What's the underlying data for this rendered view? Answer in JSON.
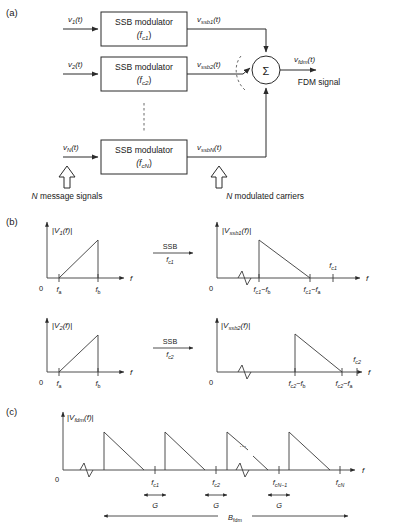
{
  "figure": {
    "panels": [
      {
        "id": "a",
        "label": "(a)"
      },
      {
        "id": "b",
        "label": "(b)"
      },
      {
        "id": "c",
        "label": "(c)"
      }
    ]
  },
  "panel_a": {
    "panel_label": "(a)",
    "blocks": [
      {
        "title": "SSB modulator",
        "carrier": "(f",
        "carrier_sub": "c1",
        "carrier_end": ")"
      },
      {
        "title": "SSB modulator",
        "carrier": "(f",
        "carrier_sub": "c2",
        "carrier_end": ")"
      },
      {
        "title": "SSB modulator",
        "carrier": "(f",
        "carrier_sub": "cN",
        "carrier_end": ")"
      }
    ],
    "inputs": [
      {
        "base": "v",
        "sub": "1",
        "tail": "(t)"
      },
      {
        "base": "v",
        "sub": "2",
        "tail": "(t)"
      },
      {
        "base": "v",
        "sub": "N",
        "tail": "(t)"
      }
    ],
    "outputs": [
      {
        "base": "v",
        "sub": "ssb1",
        "tail": "(t)"
      },
      {
        "base": "v",
        "sub": "ssb2",
        "tail": "(t)"
      },
      {
        "base": "v",
        "sub": "ssbN",
        "tail": "(t)"
      }
    ],
    "summer_symbol": "Σ",
    "result": {
      "base": "v",
      "sub": "fdm",
      "tail": "(t)"
    },
    "result_caption": "FDM signal",
    "annotation_left": "N message signals",
    "annotation_right": "N modulated carriers",
    "annotation_left_italic_prefix": "N",
    "annotation_right_italic_prefix": "N"
  },
  "panel_b": {
    "panel_label": "(b)",
    "rows": [
      {
        "left": {
          "ylabel_pre": "|V",
          "ylabel_sub": "1",
          "ylabel_post": "(f)|",
          "origin": "0",
          "xlabel": "f",
          "ticks": [
            {
              "label_pre": "f",
              "label_sub": "a"
            },
            {
              "label_pre": "f",
              "label_sub": "b"
            }
          ]
        },
        "arrow": {
          "top": "SSB",
          "bottom_pre": "f",
          "bottom_sub": "c1"
        },
        "right": {
          "ylabel_pre": "|V",
          "ylabel_sub": "ssb1",
          "ylabel_post": "(f)|",
          "origin": "0",
          "xlabel": "f",
          "ticks": [
            {
              "label_pre": "f",
              "label_sub": "c1",
              "label_post": "−f",
              "label_post_sub": "b"
            },
            {
              "label_pre": "f",
              "label_sub": "c1",
              "label_post": "−f",
              "label_post_sub": "a"
            }
          ],
          "carrier_tick": {
            "label_pre": "f",
            "label_sub": "c1"
          }
        }
      },
      {
        "left": {
          "ylabel_pre": "|V",
          "ylabel_sub": "2",
          "ylabel_post": "(f)|",
          "origin": "0",
          "xlabel": "f",
          "ticks": [
            {
              "label_pre": "f",
              "label_sub": "a"
            },
            {
              "label_pre": "f",
              "label_sub": "b"
            }
          ]
        },
        "arrow": {
          "top": "SSB",
          "bottom_pre": "f",
          "bottom_sub": "c2"
        },
        "right": {
          "ylabel_pre": "|V",
          "ylabel_sub": "ssb2",
          "ylabel_post": "(f)|",
          "origin": "0",
          "xlabel": "f",
          "ticks": [
            {
              "label_pre": "f",
              "label_sub": "c2",
              "label_post": "−f",
              "label_post_sub": "b"
            },
            {
              "label_pre": "f",
              "label_sub": "c2",
              "label_post": "−f",
              "label_post_sub": "a"
            }
          ],
          "carrier_tick": {
            "label_pre": "f",
            "label_sub": "c2"
          }
        }
      }
    ]
  },
  "panel_c": {
    "panel_label": "(c)",
    "ylabel_pre": "|V",
    "ylabel_sub": "fdm",
    "ylabel_post": "(f)|",
    "origin": "0",
    "xlabel": "f",
    "ticks": [
      {
        "label_pre": "f",
        "label_sub": "c1"
      },
      {
        "label_pre": "f",
        "label_sub": "c2"
      },
      {
        "label_pre": "f",
        "label_sub": "cN−1"
      },
      {
        "label_pre": "f",
        "label_sub": "cN"
      }
    ],
    "ellipsis": "…",
    "guard_labels": [
      "G",
      "G",
      "G"
    ],
    "bandwidth_label_pre": "B",
    "bandwidth_label_sub": "fdm"
  },
  "colors": {
    "line": "#2b2b2b",
    "dashed": "#5a5a5a",
    "text": "#1a1a1a",
    "background": "#ffffff"
  }
}
